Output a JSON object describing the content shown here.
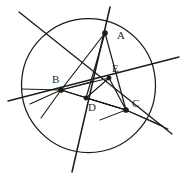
{
  "figure": {
    "background_color": "#ffffff",
    "stroke_color": "#1a1a1a",
    "label_color": "#2b2b2b",
    "width": 180,
    "height": 175
  },
  "circle": {
    "name": "circumscribed-circle",
    "cx": 88.5,
    "cy": 85.5,
    "r": 67,
    "stroke_width": 1.25
  },
  "points": [
    {
      "id": "A",
      "label": "A",
      "x": 105,
      "y": 33,
      "label_x": 117,
      "label_y": 39,
      "dot_r": 2.6,
      "marked": true
    },
    {
      "id": "B",
      "label": "B",
      "x": 61,
      "y": 90,
      "label_x": 52,
      "label_y": 83,
      "dot_r": 2.6,
      "marked": true
    },
    {
      "id": "C",
      "label": "C",
      "x": 126,
      "y": 110,
      "label_x": 132,
      "label_y": 107,
      "dot_r": 2.6,
      "marked": true
    },
    {
      "id": "D",
      "label": "D",
      "x": 86,
      "y": 98,
      "label_x": 88,
      "label_y": 111,
      "dot_r": 2.2,
      "marked": true
    },
    {
      "id": "E",
      "label": "E",
      "x": 109,
      "y": 78,
      "label_x": 112,
      "label_y": 72,
      "dot_r": 2.2,
      "marked": true
    },
    {
      "id": "P",
      "label": "",
      "x": 94,
      "y": 81,
      "label_x": 0,
      "label_y": 0,
      "dot_r": 1.8,
      "marked": false
    }
  ],
  "segments": [
    {
      "name": "line-through-A-vertical",
      "x1": 110,
      "y1": 7,
      "x2": 72,
      "y2": 172,
      "width": 1.5
    },
    {
      "name": "line-upper-left-to-C",
      "x1": 19,
      "y1": 12,
      "x2": 172,
      "y2": 134,
      "width": 1.3
    },
    {
      "name": "line-E-to-right-edge",
      "x1": 8,
      "y1": 101,
      "x2": 179,
      "y2": 57,
      "width": 1.3
    },
    {
      "name": "chord-A-to-B",
      "x1": 105,
      "y1": 33,
      "x2": 61,
      "y2": 90,
      "width": 1.2
    },
    {
      "name": "chord-A-to-C",
      "x1": 105,
      "y1": 33,
      "x2": 126,
      "y2": 110,
      "width": 1.2
    },
    {
      "name": "chord-B-to-C",
      "x1": 61,
      "y1": 90,
      "x2": 126,
      "y2": 110,
      "width": 1.2
    },
    {
      "name": "cevian-A-to-D",
      "x1": 105,
      "y1": 33,
      "x2": 86,
      "y2": 98,
      "width": 1.2
    },
    {
      "name": "cevian-B-to-E",
      "x1": 61,
      "y1": 90,
      "x2": 109,
      "y2": 78,
      "width": 1.2
    },
    {
      "name": "cevian-C-to-B-via-D",
      "x1": 126,
      "y1": 110,
      "x2": 61,
      "y2": 90,
      "width": 1.2
    },
    {
      "name": "cevian-D-to-C",
      "x1": 86,
      "y1": 98,
      "x2": 126,
      "y2": 110,
      "width": 1.2
    },
    {
      "name": "cevian-E-to-C",
      "x1": 109,
      "y1": 78,
      "x2": 126,
      "y2": 110,
      "width": 1.2
    },
    {
      "name": "cevian-E-to-D",
      "x1": 109,
      "y1": 78,
      "x2": 86,
      "y2": 98,
      "width": 1.1
    },
    {
      "name": "ray-B-to-left-horizontal",
      "x1": 61,
      "y1": 90,
      "x2": 22,
      "y2": 89,
      "width": 1.2
    },
    {
      "name": "ray-B-to-lower-left",
      "x1": 61,
      "y1": 90,
      "x2": 30,
      "y2": 104,
      "width": 1.1
    },
    {
      "name": "ray-B-to-bottom-arc",
      "x1": 61,
      "y1": 90,
      "x2": 41,
      "y2": 118,
      "width": 1.1
    },
    {
      "name": "ray-C-to-lower-right-a",
      "x1": 126,
      "y1": 110,
      "x2": 168,
      "y2": 129,
      "width": 1.1
    },
    {
      "name": "ray-C-to-lower-right-b",
      "x1": 126,
      "y1": 110,
      "x2": 163,
      "y2": 126,
      "width": 1.0
    },
    {
      "name": "ray-C-to-lower-left",
      "x1": 126,
      "y1": 110,
      "x2": 100,
      "y2": 120,
      "width": 1.0
    },
    {
      "name": "ray-through-intersection-P",
      "x1": 94,
      "y1": 81,
      "x2": 61,
      "y2": 90,
      "width": 1.1
    }
  ]
}
